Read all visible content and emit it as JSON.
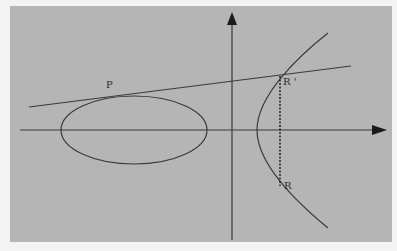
{
  "figure": {
    "background_color": "#b5b5b5",
    "page_color": "#f3f3f3",
    "stroke_color": "#3a3a3a",
    "labels": {
      "p": "P",
      "r_prime": "R '",
      "r": "R"
    }
  }
}
